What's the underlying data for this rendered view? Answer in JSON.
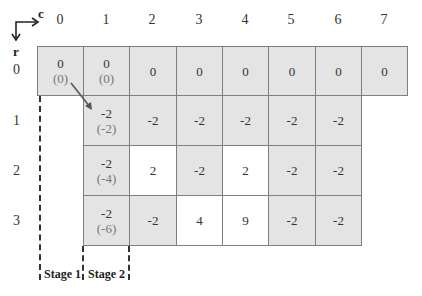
{
  "axes": {
    "column_axis_label": "c",
    "row_axis_label": "r",
    "column_headers": [
      "0",
      "1",
      "2",
      "3",
      "4",
      "5",
      "6",
      "7"
    ],
    "row_headers": [
      "0",
      "1",
      "2",
      "3"
    ]
  },
  "grid": {
    "rows": [
      [
        {
          "col": 0,
          "value": "0",
          "sub": "(0)",
          "fill": "gray"
        },
        {
          "col": 1,
          "value": "0",
          "sub": "(0)",
          "fill": "gray"
        },
        {
          "col": 2,
          "value": "0",
          "fill": "gray"
        },
        {
          "col": 3,
          "value": "0",
          "fill": "gray"
        },
        {
          "col": 4,
          "value": "0",
          "fill": "gray"
        },
        {
          "col": 5,
          "value": "0",
          "fill": "gray"
        },
        {
          "col": 6,
          "value": "0",
          "fill": "gray"
        },
        {
          "col": 7,
          "value": "0",
          "fill": "gray"
        }
      ],
      [
        {
          "col": 1,
          "value": "-2",
          "sub": "(-2)",
          "fill": "gray"
        },
        {
          "col": 2,
          "value": "-2",
          "fill": "gray"
        },
        {
          "col": 3,
          "value": "-2",
          "fill": "gray"
        },
        {
          "col": 4,
          "value": "-2",
          "fill": "gray"
        },
        {
          "col": 5,
          "value": "-2",
          "fill": "gray"
        },
        {
          "col": 6,
          "value": "-2",
          "fill": "gray"
        }
      ],
      [
        {
          "col": 1,
          "value": "-2",
          "sub": "(-4)",
          "fill": "gray"
        },
        {
          "col": 2,
          "value": "2",
          "fill": "white"
        },
        {
          "col": 3,
          "value": "-2",
          "fill": "gray"
        },
        {
          "col": 4,
          "value": "2",
          "fill": "white"
        },
        {
          "col": 5,
          "value": "-2",
          "fill": "gray"
        },
        {
          "col": 6,
          "value": "-2",
          "fill": "gray"
        }
      ],
      [
        {
          "col": 1,
          "value": "-2",
          "sub": "(-6)",
          "fill": "gray"
        },
        {
          "col": 2,
          "value": "-2",
          "fill": "gray"
        },
        {
          "col": 3,
          "value": "4",
          "fill": "white"
        },
        {
          "col": 4,
          "value": "9",
          "fill": "white"
        },
        {
          "col": 5,
          "value": "-2",
          "fill": "gray"
        },
        {
          "col": 6,
          "value": "-2",
          "fill": "gray"
        }
      ]
    ]
  },
  "annotations": {
    "arrow": {
      "from": "cell r0 c0",
      "to": "cell r1 c1"
    },
    "stages": [
      "Stage 1",
      "Stage 2"
    ]
  },
  "colors": {
    "cell_gray": "#e4e4e4",
    "cell_white": "#ffffff",
    "border": "#7f7f7f",
    "sub_text": "#777777"
  }
}
